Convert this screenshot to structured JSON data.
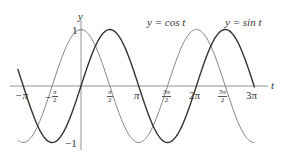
{
  "chart_data": {
    "type": "line",
    "title": "",
    "xlabel": "t",
    "ylabel": "y",
    "xlim": [
      -3.5,
      9.8
    ],
    "ylim": [
      -1,
      1
    ],
    "grid": false,
    "legend_position": "inline labels above curves",
    "series": [
      {
        "name": "y = cos t",
        "function": "cos",
        "color": "#777777",
        "stroke_width": 0.9
      },
      {
        "name": "y = sin t",
        "function": "sin",
        "color": "#333333",
        "stroke_width": 1.4
      }
    ],
    "x_ticks": [
      {
        "value": -3.14159,
        "label": "−π"
      },
      {
        "value": -1.5708,
        "label_num": "π",
        "label_den": "2",
        "sign": "−"
      },
      {
        "value": 1.5708,
        "label_num": "π",
        "label_den": "2",
        "sign": ""
      },
      {
        "value": 3.14159,
        "label": "π"
      },
      {
        "value": 4.71239,
        "label_num": "3π",
        "label_den": "2",
        "sign": ""
      },
      {
        "value": 6.28319,
        "label": "2π"
      },
      {
        "value": 7.85398,
        "label_num": "5π",
        "label_den": "2",
        "sign": ""
      },
      {
        "value": 9.42478,
        "label": "3π"
      }
    ],
    "y_ticks": [
      {
        "value": 1,
        "label": "1"
      },
      {
        "value": -1,
        "label": "−1"
      }
    ]
  },
  "labels": {
    "y_axis": "y",
    "t_axis": "t",
    "one": "1",
    "neg_one": "−1",
    "cos_label": "y = cos t",
    "sin_label": "y = sin t",
    "neg_pi": "−π",
    "pi": "π",
    "two_pi": "2π",
    "three_pi": "3π",
    "neg_half_sign": "−",
    "half_pi_num": "π",
    "three_half_pi_num": "3π",
    "five_half_pi_num": "5π",
    "den": "2"
  }
}
